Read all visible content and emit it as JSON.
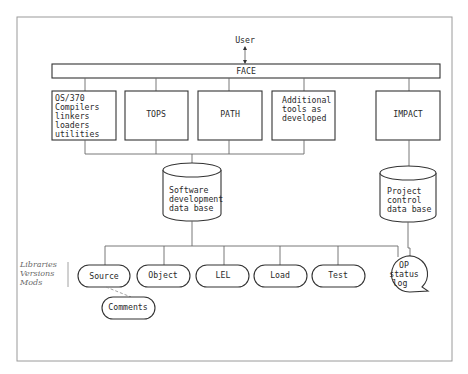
{
  "diagram": {
    "user_label": "User",
    "face_label": "FACE",
    "tools": [
      {
        "lines": [
          "OS/370",
          "Compilers",
          "linkers",
          "loaders",
          "utilities"
        ]
      },
      {
        "lines": [
          "TOPS"
        ]
      },
      {
        "lines": [
          "PATH"
        ]
      },
      {
        "lines": [
          "Additional",
          "tools as",
          "developed"
        ]
      },
      {
        "lines": [
          "IMPACT"
        ]
      }
    ],
    "databases": {
      "software": {
        "lines": [
          "Software",
          "development",
          "data base"
        ]
      },
      "project": {
        "lines": [
          "Project",
          "control",
          "data base"
        ]
      }
    },
    "side_note": {
      "lines": [
        "Libraries",
        "Versions",
        "Mods"
      ]
    },
    "libraries": [
      "Source",
      "Object",
      "LEL",
      "Load",
      "Test"
    ],
    "op_status": {
      "lines": [
        "OP",
        "status",
        "log"
      ]
    },
    "comments_label": "Comments",
    "colors": {
      "ink": "#2a2a2a",
      "line": "#6a6a6a",
      "frame": "#9a9a9a",
      "background": "#ffffff"
    }
  }
}
